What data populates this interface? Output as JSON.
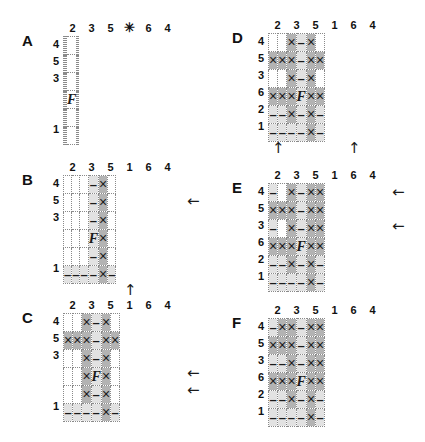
{
  "figure": {
    "title": "",
    "cell_marks": {
      "x": "×",
      "dash": "–",
      "f": "F",
      "empty": ""
    },
    "arrow_glyphs": {
      "left": "←",
      "up": "↑"
    }
  },
  "panels": [
    {
      "letter": "A",
      "col_headers": [
        "2",
        "3",
        "5",
        "✳",
        "6",
        "4"
      ],
      "row_headers": [
        "4",
        "5",
        "3",
        "",
        "",
        "1"
      ],
      "cells": [
        [
          {
            "s": "w",
            "m": ""
          },
          {
            "s": "w",
            "m": ""
          },
          {
            "s": "w",
            "m": ""
          },
          {
            "s": "w",
            "m": ""
          },
          {
            "s": "w",
            "m": ""
          },
          {
            "s": "w",
            "m": ""
          }
        ],
        [
          {
            "s": "w",
            "m": ""
          },
          {
            "s": "w",
            "m": ""
          },
          {
            "s": "w",
            "m": ""
          },
          {
            "s": "w",
            "m": ""
          },
          {
            "s": "w",
            "m": ""
          },
          {
            "s": "w",
            "m": ""
          }
        ],
        [
          {
            "s": "w",
            "m": ""
          },
          {
            "s": "w",
            "m": ""
          },
          {
            "s": "w",
            "m": ""
          },
          {
            "s": "w",
            "m": ""
          },
          {
            "s": "w",
            "m": ""
          },
          {
            "s": "w",
            "m": ""
          }
        ],
        [
          {
            "s": "w",
            "m": ""
          },
          {
            "s": "w",
            "m": ""
          },
          {
            "s": "w",
            "m": ""
          },
          {
            "s": "w",
            "m": "F"
          },
          {
            "s": "w",
            "m": ""
          },
          {
            "s": "w",
            "m": ""
          }
        ],
        [
          {
            "s": "w",
            "m": ""
          },
          {
            "s": "w",
            "m": ""
          },
          {
            "s": "w",
            "m": ""
          },
          {
            "s": "w",
            "m": ""
          },
          {
            "s": "w",
            "m": ""
          },
          {
            "s": "w",
            "m": ""
          }
        ],
        [
          {
            "s": "w",
            "m": ""
          },
          {
            "s": "w",
            "m": ""
          },
          {
            "s": "w",
            "m": ""
          },
          {
            "s": "w",
            "m": ""
          },
          {
            "s": "w",
            "m": ""
          },
          {
            "s": "w",
            "m": ""
          }
        ]
      ],
      "arrows_left": [],
      "arrows_up": []
    },
    {
      "letter": "B",
      "col_headers": [
        "2",
        "3",
        "5",
        "1",
        "6",
        "4"
      ],
      "row_headers": [
        "4",
        "5",
        "3",
        "",
        "",
        "1"
      ],
      "cells": [
        [
          {
            "s": "w",
            "m": ""
          },
          {
            "s": "w",
            "m": ""
          },
          {
            "s": "w",
            "m": ""
          },
          {
            "s": "lt",
            "m": "–"
          },
          {
            "s": "dk",
            "m": "×"
          },
          {
            "s": "w",
            "m": ""
          }
        ],
        [
          {
            "s": "w",
            "m": ""
          },
          {
            "s": "w",
            "m": ""
          },
          {
            "s": "w",
            "m": ""
          },
          {
            "s": "lt",
            "m": "–"
          },
          {
            "s": "dk",
            "m": "×"
          },
          {
            "s": "w",
            "m": ""
          }
        ],
        [
          {
            "s": "w",
            "m": ""
          },
          {
            "s": "w",
            "m": ""
          },
          {
            "s": "w",
            "m": ""
          },
          {
            "s": "lt",
            "m": "–"
          },
          {
            "s": "dk",
            "m": "×"
          },
          {
            "s": "w",
            "m": ""
          }
        ],
        [
          {
            "s": "w",
            "m": ""
          },
          {
            "s": "w",
            "m": ""
          },
          {
            "s": "w",
            "m": ""
          },
          {
            "s": "lt",
            "m": "F"
          },
          {
            "s": "dk",
            "m": "×"
          },
          {
            "s": "w",
            "m": ""
          }
        ],
        [
          {
            "s": "w",
            "m": ""
          },
          {
            "s": "w",
            "m": ""
          },
          {
            "s": "w",
            "m": ""
          },
          {
            "s": "lt",
            "m": "–"
          },
          {
            "s": "dk",
            "m": "×"
          },
          {
            "s": "w",
            "m": ""
          }
        ],
        [
          {
            "s": "lt",
            "m": "–"
          },
          {
            "s": "lt",
            "m": "–"
          },
          {
            "s": "lt",
            "m": "–"
          },
          {
            "s": "lt",
            "m": "–"
          },
          {
            "s": "dk",
            "m": "×"
          },
          {
            "s": "lt",
            "m": "–"
          }
        ]
      ],
      "arrows_left": [
        1
      ],
      "arrows_up": [
        3
      ]
    },
    {
      "letter": "C",
      "col_headers": [
        "2",
        "3",
        "5",
        "1",
        "6",
        "4"
      ],
      "row_headers": [
        "4",
        "5",
        "3",
        "",
        "",
        "1"
      ],
      "cells": [
        [
          {
            "s": "w",
            "m": ""
          },
          {
            "s": "w",
            "m": ""
          },
          {
            "s": "dk",
            "m": "×"
          },
          {
            "s": "lt",
            "m": "–"
          },
          {
            "s": "dk",
            "m": "×"
          },
          {
            "s": "w",
            "m": ""
          }
        ],
        [
          {
            "s": "dk",
            "m": "×"
          },
          {
            "s": "dk",
            "m": "×"
          },
          {
            "s": "dk",
            "m": "×"
          },
          {
            "s": "lt",
            "m": "–"
          },
          {
            "s": "dk",
            "m": "×"
          },
          {
            "s": "dk",
            "m": "×"
          }
        ],
        [
          {
            "s": "w",
            "m": ""
          },
          {
            "s": "w",
            "m": ""
          },
          {
            "s": "dk",
            "m": "×"
          },
          {
            "s": "lt",
            "m": "–"
          },
          {
            "s": "dk",
            "m": "×"
          },
          {
            "s": "w",
            "m": ""
          }
        ],
        [
          {
            "s": "w",
            "m": ""
          },
          {
            "s": "w",
            "m": ""
          },
          {
            "s": "dk",
            "m": "×"
          },
          {
            "s": "lt",
            "m": "F"
          },
          {
            "s": "dk",
            "m": "×"
          },
          {
            "s": "w",
            "m": ""
          }
        ],
        [
          {
            "s": "w",
            "m": ""
          },
          {
            "s": "w",
            "m": ""
          },
          {
            "s": "dk",
            "m": "×"
          },
          {
            "s": "lt",
            "m": "–"
          },
          {
            "s": "dk",
            "m": "×"
          },
          {
            "s": "w",
            "m": ""
          }
        ],
        [
          {
            "s": "lt",
            "m": "–"
          },
          {
            "s": "lt",
            "m": "–"
          },
          {
            "s": "lt",
            "m": "–"
          },
          {
            "s": "lt",
            "m": "–"
          },
          {
            "s": "dk",
            "m": "×"
          },
          {
            "s": "lt",
            "m": "–"
          }
        ]
      ],
      "arrows_left": [
        3,
        4
      ],
      "arrows_up": []
    },
    {
      "letter": "D",
      "col_headers": [
        "2",
        "3",
        "5",
        "1",
        "6",
        "4"
      ],
      "row_headers": [
        "4",
        "5",
        "3",
        "6",
        "2",
        "1"
      ],
      "cells": [
        [
          {
            "s": "w",
            "m": ""
          },
          {
            "s": "w",
            "m": ""
          },
          {
            "s": "dk",
            "m": "×"
          },
          {
            "s": "lt",
            "m": "–"
          },
          {
            "s": "dk",
            "m": "×"
          },
          {
            "s": "w",
            "m": ""
          }
        ],
        [
          {
            "s": "dk",
            "m": "×"
          },
          {
            "s": "dk",
            "m": "×"
          },
          {
            "s": "dk",
            "m": "×"
          },
          {
            "s": "lt",
            "m": "–"
          },
          {
            "s": "dk",
            "m": "×"
          },
          {
            "s": "dk",
            "m": "×"
          }
        ],
        [
          {
            "s": "w",
            "m": ""
          },
          {
            "s": "w",
            "m": ""
          },
          {
            "s": "dk",
            "m": "×"
          },
          {
            "s": "lt",
            "m": "–"
          },
          {
            "s": "dk",
            "m": "×"
          },
          {
            "s": "w",
            "m": ""
          }
        ],
        [
          {
            "s": "dk",
            "m": "×"
          },
          {
            "s": "dk",
            "m": "×"
          },
          {
            "s": "dk",
            "m": "×"
          },
          {
            "s": "lt",
            "m": "F"
          },
          {
            "s": "dk",
            "m": "×"
          },
          {
            "s": "dk",
            "m": "×"
          }
        ],
        [
          {
            "s": "lt",
            "m": "–"
          },
          {
            "s": "lt",
            "m": "–"
          },
          {
            "s": "dk",
            "m": "×"
          },
          {
            "s": "lt",
            "m": "–"
          },
          {
            "s": "dk",
            "m": "×"
          },
          {
            "s": "lt",
            "m": "–"
          }
        ],
        [
          {
            "s": "lt",
            "m": "–"
          },
          {
            "s": "lt",
            "m": "–"
          },
          {
            "s": "lt",
            "m": "–"
          },
          {
            "s": "lt",
            "m": "–"
          },
          {
            "s": "dk",
            "m": "×"
          },
          {
            "s": "lt",
            "m": "–"
          }
        ]
      ],
      "arrows_left": [],
      "arrows_up": [
        0,
        4
      ]
    },
    {
      "letter": "E",
      "col_headers": [
        "2",
        "3",
        "5",
        "1",
        "6",
        "4"
      ],
      "row_headers": [
        "4",
        "5",
        "3",
        "6",
        "2",
        "1"
      ],
      "cells": [
        [
          {
            "s": "lt",
            "m": "–"
          },
          {
            "s": "w",
            "m": ""
          },
          {
            "s": "dk",
            "m": "×"
          },
          {
            "s": "lt",
            "m": "–"
          },
          {
            "s": "dk",
            "m": "×"
          },
          {
            "s": "dk",
            "m": "×"
          }
        ],
        [
          {
            "s": "dk",
            "m": "×"
          },
          {
            "s": "dk",
            "m": "×"
          },
          {
            "s": "dk",
            "m": "×"
          },
          {
            "s": "lt",
            "m": "–"
          },
          {
            "s": "dk",
            "m": "×"
          },
          {
            "s": "dk",
            "m": "×"
          }
        ],
        [
          {
            "s": "lt",
            "m": "–"
          },
          {
            "s": "w",
            "m": ""
          },
          {
            "s": "dk",
            "m": "×"
          },
          {
            "s": "lt",
            "m": "–"
          },
          {
            "s": "dk",
            "m": "×"
          },
          {
            "s": "dk",
            "m": "×"
          }
        ],
        [
          {
            "s": "dk",
            "m": "×"
          },
          {
            "s": "dk",
            "m": "×"
          },
          {
            "s": "dk",
            "m": "×"
          },
          {
            "s": "lt",
            "m": "F"
          },
          {
            "s": "dk",
            "m": "×"
          },
          {
            "s": "dk",
            "m": "×"
          }
        ],
        [
          {
            "s": "lt",
            "m": "–"
          },
          {
            "s": "lt",
            "m": "–"
          },
          {
            "s": "dk",
            "m": "×"
          },
          {
            "s": "lt",
            "m": "–"
          },
          {
            "s": "dk",
            "m": "×"
          },
          {
            "s": "lt",
            "m": "–"
          }
        ],
        [
          {
            "s": "lt",
            "m": "–"
          },
          {
            "s": "lt",
            "m": "–"
          },
          {
            "s": "lt",
            "m": "–"
          },
          {
            "s": "lt",
            "m": "–"
          },
          {
            "s": "dk",
            "m": "×"
          },
          {
            "s": "lt",
            "m": "–"
          }
        ]
      ],
      "arrows_left": [
        0,
        2
      ],
      "arrows_up": []
    },
    {
      "letter": "F",
      "col_headers": [
        "2",
        "3",
        "5",
        "1",
        "6",
        "4"
      ],
      "row_headers": [
        "4",
        "5",
        "3",
        "6",
        "2",
        "1"
      ],
      "cells": [
        [
          {
            "s": "lt",
            "m": "–"
          },
          {
            "s": "dk",
            "m": "×"
          },
          {
            "s": "dk",
            "m": "×"
          },
          {
            "s": "lt",
            "m": "–"
          },
          {
            "s": "dk",
            "m": "×"
          },
          {
            "s": "dk",
            "m": "×"
          }
        ],
        [
          {
            "s": "dk",
            "m": "×"
          },
          {
            "s": "dk",
            "m": "×"
          },
          {
            "s": "dk",
            "m": "×"
          },
          {
            "s": "lt",
            "m": "–"
          },
          {
            "s": "dk",
            "m": "×"
          },
          {
            "s": "dk",
            "m": "×"
          }
        ],
        [
          {
            "s": "lt",
            "m": "–"
          },
          {
            "s": "lt",
            "m": "–"
          },
          {
            "s": "dk",
            "m": "×"
          },
          {
            "s": "lt",
            "m": "–"
          },
          {
            "s": "dk",
            "m": "×"
          },
          {
            "s": "dk",
            "m": "×"
          }
        ],
        [
          {
            "s": "dk",
            "m": "×"
          },
          {
            "s": "dk",
            "m": "×"
          },
          {
            "s": "dk",
            "m": "×"
          },
          {
            "s": "lt",
            "m": "F"
          },
          {
            "s": "dk",
            "m": "×"
          },
          {
            "s": "dk",
            "m": "×"
          }
        ],
        [
          {
            "s": "lt",
            "m": "–"
          },
          {
            "s": "lt",
            "m": "–"
          },
          {
            "s": "dk",
            "m": "×"
          },
          {
            "s": "lt",
            "m": "–"
          },
          {
            "s": "dk",
            "m": "×"
          },
          {
            "s": "lt",
            "m": "–"
          }
        ],
        [
          {
            "s": "lt",
            "m": "–"
          },
          {
            "s": "lt",
            "m": "–"
          },
          {
            "s": "lt",
            "m": "–"
          },
          {
            "s": "lt",
            "m": "–"
          },
          {
            "s": "dk",
            "m": "×"
          },
          {
            "s": "lt",
            "m": "–"
          }
        ]
      ],
      "arrows_left": [],
      "arrows_up": []
    }
  ]
}
